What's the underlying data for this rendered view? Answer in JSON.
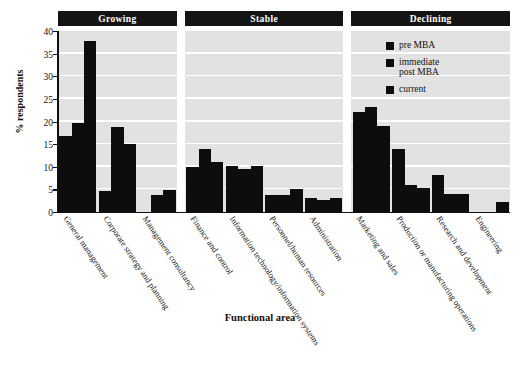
{
  "chart_data": {
    "type": "bar",
    "title": "",
    "xlabel": "Functional area",
    "ylabel": "% respondents",
    "ylim": [
      0,
      40
    ],
    "ytick_labels": [
      "0",
      "5",
      "10",
      "15",
      "20",
      "25",
      "30",
      "35",
      "40"
    ],
    "ytick_values": [
      0,
      5,
      10,
      15,
      20,
      25,
      30,
      35,
      40
    ],
    "grid": true,
    "legend_position": "upper-right-inside",
    "series": [
      {
        "name": "pre MBA",
        "values": [
          16.8,
          4.7,
          0.0,
          10.0,
          10.2,
          3.8,
          3.0,
          22.2,
          14.0,
          8.2,
          0.0
        ]
      },
      {
        "name": "immediate post MBA",
        "values": [
          19.7,
          18.8,
          3.8,
          14.0,
          9.4,
          3.8,
          2.6,
          23.2,
          6.0,
          4.0,
          0.0
        ]
      },
      {
        "name": "current",
        "values": [
          37.8,
          15.0,
          4.8,
          11.0,
          10.2,
          5.0,
          3.2,
          19.0,
          5.2,
          4.0,
          2.2
        ]
      }
    ],
    "categories": [
      "General management",
      "Corporate strategy and planning",
      "Management consultancy",
      "Finance and control",
      "Information technology/information systems",
      "Personnel/human resources",
      "Administration",
      "Marketing and sales",
      "Production or manufacturing operations",
      "Research and development",
      "Engineering"
    ],
    "groups": [
      {
        "label": "Growing",
        "category_start": 0,
        "category_count": 3
      },
      {
        "label": "Stable",
        "category_start": 3,
        "category_count": 4
      },
      {
        "label": "Declining",
        "category_start": 7,
        "category_count": 4
      }
    ],
    "colors": {
      "bar": "#0d0d0d",
      "plot_background": "#e2e2e2",
      "gridline": "#ffffff",
      "group_band": "#141414",
      "group_band_text": "#ffffff",
      "axis": "#111111"
    }
  }
}
